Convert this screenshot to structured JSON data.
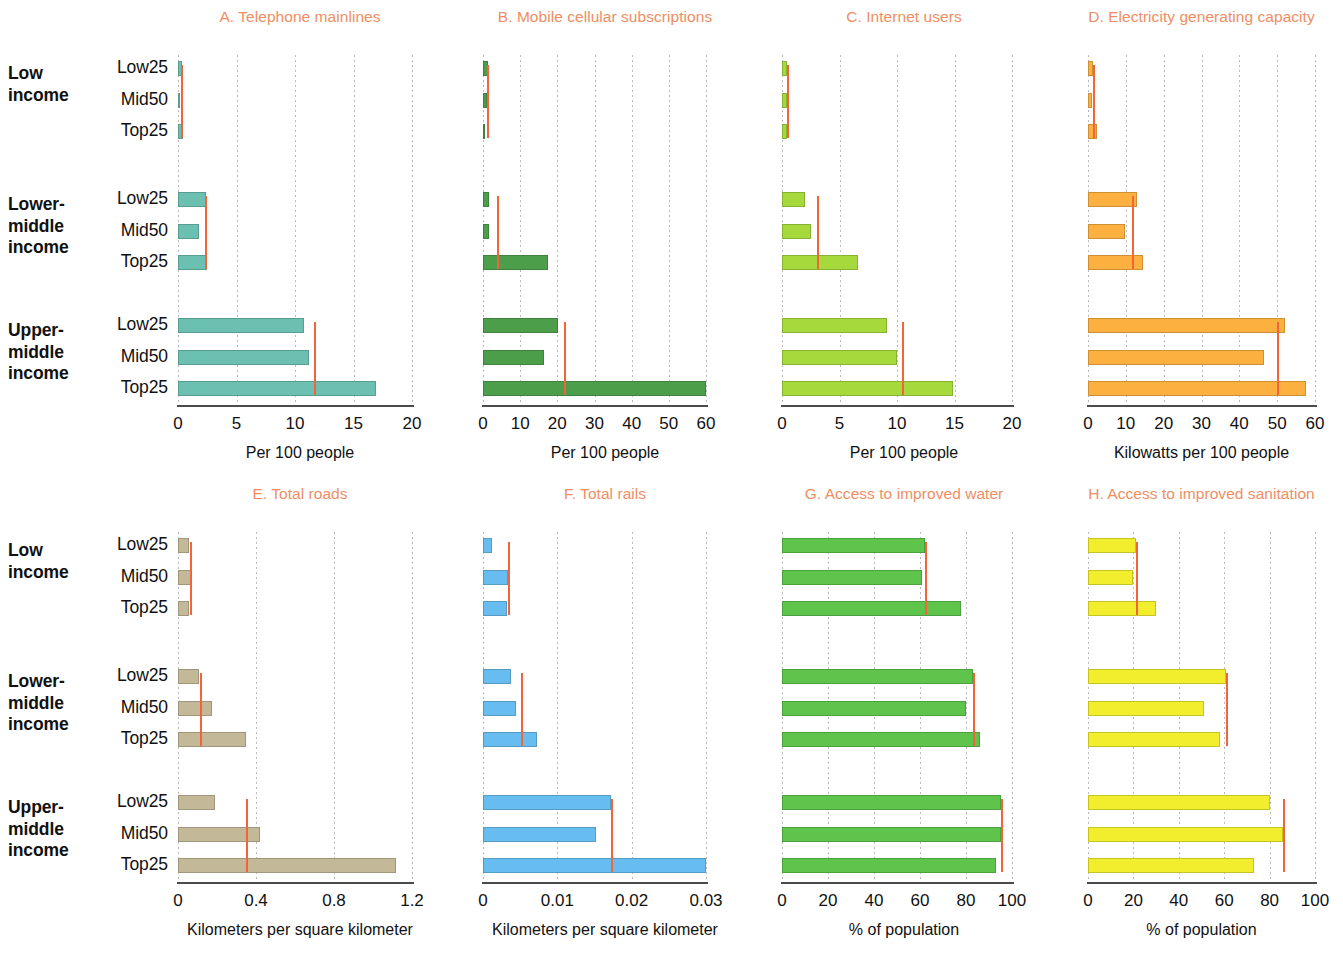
{
  "figure": {
    "accent_title_color": "#ef8e63",
    "reference_line_color": "#f4633a",
    "groups": [
      {
        "label_line1": "Low",
        "label_line2": "income",
        "label_line3": ""
      },
      {
        "label_line1": "Lower-",
        "label_line2": "middle",
        "label_line3": "income"
      },
      {
        "label_line1": "Upper-",
        "label_line2": "middle",
        "label_line3": "income"
      }
    ],
    "categories": [
      "Low25",
      "Mid50",
      "Top25"
    ]
  },
  "chart_data": [
    {
      "type": "bar",
      "panel": "A",
      "title": "A.  Telephone mainlines",
      "xlabel": "Per 100 people",
      "ylabel": "",
      "xlim": [
        0,
        20
      ],
      "ticks": [
        "0",
        "5",
        "10",
        "15",
        "20"
      ],
      "tick_values": [
        0,
        5,
        10,
        15,
        20
      ],
      "bar_color": "#6cc0b2",
      "grid": true,
      "categories": [
        "Low25",
        "Mid50",
        "Top25"
      ],
      "series": [
        {
          "name": "Low income",
          "values": [
            0.35,
            0.2,
            0.4
          ],
          "reference": 0.25
        },
        {
          "name": "Lower-middle income",
          "values": [
            2.4,
            1.8,
            2.5
          ],
          "reference": 2.3
        },
        {
          "name": "Upper-middle income",
          "values": [
            10.8,
            11.2,
            16.9
          ],
          "reference": 11.6
        }
      ]
    },
    {
      "type": "bar",
      "panel": "B",
      "title": "B.  Mobile cellular subscriptions",
      "xlabel": "Per 100 people",
      "ylabel": "",
      "xlim": [
        0,
        60
      ],
      "ticks": [
        "0",
        "10",
        "20",
        "30",
        "40",
        "50",
        "60"
      ],
      "tick_values": [
        0,
        10,
        20,
        30,
        40,
        50,
        60
      ],
      "bar_color": "#4d9e4b",
      "grid": true,
      "categories": [
        "Low25",
        "Mid50",
        "Top25"
      ],
      "series": [
        {
          "name": "Low income",
          "values": [
            1.3,
            1.0,
            0.2
          ],
          "reference": 1.1
        },
        {
          "name": "Lower-middle income",
          "values": [
            1.6,
            1.6,
            17.5
          ],
          "reference": 3.9
        },
        {
          "name": "Upper-middle income",
          "values": [
            20.3,
            16.4,
            60.0
          ],
          "reference": 21.8
        }
      ]
    },
    {
      "type": "bar",
      "panel": "C",
      "title": "C.  Internet users",
      "xlabel": "Per 100 people",
      "ylabel": "",
      "xlim": [
        0,
        20
      ],
      "ticks": [
        "0",
        "5",
        "10",
        "15",
        "20"
      ],
      "tick_values": [
        0,
        5,
        10,
        15,
        20
      ],
      "bar_color": "#a6d93c",
      "grid": true,
      "categories": [
        "Low25",
        "Mid50",
        "Top25"
      ],
      "series": [
        {
          "name": "Low income",
          "values": [
            0.45,
            0.4,
            0.45
          ],
          "reference": 0.4
        },
        {
          "name": "Lower-middle income",
          "values": [
            2.0,
            2.5,
            6.6
          ],
          "reference": 3.0
        },
        {
          "name": "Upper-middle income",
          "values": [
            9.1,
            10.0,
            14.9
          ],
          "reference": 10.4
        }
      ]
    },
    {
      "type": "bar",
      "panel": "D",
      "title": "D.  Electricity generating capacity",
      "xlabel": "Kilowatts per 100 people",
      "ylabel": "",
      "xlim": [
        0,
        60
      ],
      "ticks": [
        "0",
        "10",
        "20",
        "30",
        "40",
        "50",
        "60"
      ],
      "tick_values": [
        0,
        10,
        20,
        30,
        40,
        50,
        60
      ],
      "bar_color": "#fbb040",
      "grid": true,
      "categories": [
        "Low25",
        "Mid50",
        "Top25"
      ],
      "series": [
        {
          "name": "Low income",
          "values": [
            1.2,
            1.0,
            2.5
          ],
          "reference": 1.3
        },
        {
          "name": "Lower-middle income",
          "values": [
            13.0,
            9.8,
            14.6
          ],
          "reference": 11.5
        },
        {
          "name": "Upper-middle income",
          "values": [
            52.0,
            46.5,
            57.5
          ],
          "reference": 50.0
        }
      ]
    },
    {
      "type": "bar",
      "panel": "E",
      "title": "E.  Total roads",
      "xlabel": "Kilometers per square kilometer",
      "ylabel": "",
      "xlim": [
        0,
        1.2
      ],
      "ticks": [
        "0",
        "0.4",
        "0.8",
        "1.2"
      ],
      "tick_values": [
        0,
        0.4,
        0.8,
        1.2
      ],
      "bar_color": "#c3b897",
      "grid": true,
      "categories": [
        "Low25",
        "Mid50",
        "Top25"
      ],
      "series": [
        {
          "name": "Low income",
          "values": [
            0.055,
            0.065,
            0.055
          ],
          "reference": 0.06
        },
        {
          "name": "Lower-middle income",
          "values": [
            0.11,
            0.175,
            0.35
          ],
          "reference": 0.115
        },
        {
          "name": "Upper-middle income",
          "values": [
            0.19,
            0.42,
            1.12
          ],
          "reference": 0.35
        }
      ]
    },
    {
      "type": "bar",
      "panel": "F",
      "title": "F.  Total rails",
      "xlabel": "Kilometers per square kilometer",
      "ylabel": "",
      "xlim": [
        0,
        0.03
      ],
      "ticks": [
        "0",
        "0.01",
        "0.02",
        "0.03"
      ],
      "tick_values": [
        0,
        0.01,
        0.02,
        0.03
      ],
      "bar_color": "#68bdf0",
      "grid": true,
      "categories": [
        "Low25",
        "Mid50",
        "Top25"
      ],
      "series": [
        {
          "name": "Low income",
          "values": [
            0.0012,
            0.0034,
            0.0032
          ],
          "reference": 0.0033
        },
        {
          "name": "Lower-middle income",
          "values": [
            0.0038,
            0.0045,
            0.0072
          ],
          "reference": 0.0051
        },
        {
          "name": "Upper-middle income",
          "values": [
            0.0172,
            0.0152,
            0.03
          ],
          "reference": 0.0172
        }
      ]
    },
    {
      "type": "bar",
      "panel": "G",
      "title": "G.  Access to improved water",
      "xlabel": "% of population",
      "ylabel": "",
      "xlim": [
        0,
        100
      ],
      "ticks": [
        "0",
        "20",
        "40",
        "60",
        "80",
        "100"
      ],
      "tick_values": [
        0,
        20,
        40,
        60,
        80,
        100
      ],
      "bar_color": "#5fc44c",
      "grid": true,
      "categories": [
        "Low25",
        "Mid50",
        "Top25"
      ],
      "series": [
        {
          "name": "Low income",
          "values": [
            62,
            61,
            78
          ],
          "reference": 62
        },
        {
          "name": "Lower-middle income",
          "values": [
            83,
            80,
            86
          ],
          "reference": 83
        },
        {
          "name": "Upper-middle income",
          "values": [
            95,
            95,
            93
          ],
          "reference": 95
        }
      ]
    },
    {
      "type": "bar",
      "panel": "H",
      "title": "H.  Access to improved sanitation",
      "xlabel": "% of population",
      "ylabel": "",
      "xlim": [
        0,
        100
      ],
      "ticks": [
        "0",
        "20",
        "40",
        "60",
        "80",
        "100"
      ],
      "tick_values": [
        0,
        20,
        40,
        60,
        80,
        100
      ],
      "bar_color": "#f2ee2e",
      "grid": true,
      "categories": [
        "Low25",
        "Mid50",
        "Top25"
      ],
      "series": [
        {
          "name": "Low income",
          "values": [
            21,
            20,
            30
          ],
          "reference": 21
        },
        {
          "name": "Lower-middle income",
          "values": [
            61,
            51,
            58
          ],
          "reference": 61
        },
        {
          "name": "Upper-middle income",
          "values": [
            80,
            86,
            73
          ],
          "reference": 86
        }
      ]
    }
  ]
}
